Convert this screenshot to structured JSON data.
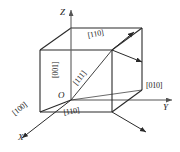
{
  "figure": {
    "background_color": "#ffffff",
    "line_color": "#2a2a2a",
    "axis_color": "#555555",
    "text_color": "#1a1a1a"
  },
  "axes": [
    {
      "name": "x-axis",
      "label": "X",
      "direction": "down-left"
    },
    {
      "name": "y-axis",
      "label": "Y",
      "direction": "right"
    },
    {
      "name": "z-axis",
      "label": "Z",
      "direction": "up"
    }
  ],
  "origin": {
    "label": "O"
  },
  "direction_labels": {
    "x_direction": "[100]",
    "y_direction": "[010]",
    "z_direction": "[001]",
    "body_diagonal": "[111]",
    "face_diagonal_top": "[110]",
    "face_diagonal_bottom": "[110]"
  },
  "arrows": [
    {
      "name": "arrow-110-up",
      "from": "top-front-vertex",
      "to": "upper-right"
    },
    {
      "name": "arrow-110-right",
      "from": "top-front-vertex",
      "to": "right"
    },
    {
      "name": "arrow-bottom-right",
      "from": "bottom-front-vertex",
      "to": "lower-right"
    },
    {
      "name": "arrow-x-axis",
      "from": "origin",
      "to": "lower-left"
    }
  ]
}
